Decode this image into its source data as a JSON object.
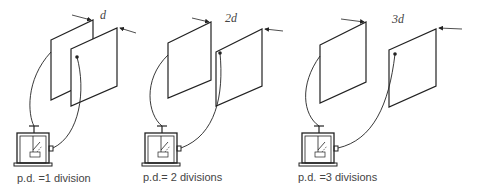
{
  "diagram": {
    "panels": [
      {
        "separation_label": "d",
        "pd_label": "p.d. =1 division"
      },
      {
        "separation_label": "2d",
        "pd_label": "p.d.= 2 divisions"
      },
      {
        "separation_label": "3d",
        "pd_label": "p.d. =3 divisions"
      }
    ],
    "colors": {
      "line": "#222222",
      "text": "#444444",
      "background": "#ffffff"
    }
  }
}
